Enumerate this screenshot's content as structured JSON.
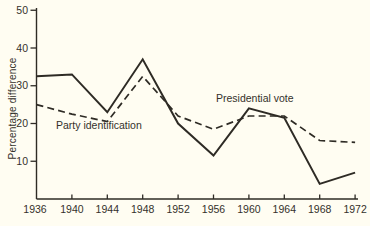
{
  "figure": {
    "ylabel": "Percentage difference",
    "series_labels": {
      "solid": "Presidential vote",
      "dashed": "Party identification"
    }
  },
  "chart_data": {
    "type": "line",
    "title": "",
    "xlabel": "",
    "ylabel": "Percentage difference",
    "x": [
      1936,
      1940,
      1944,
      1948,
      1952,
      1956,
      1960,
      1964,
      1968,
      1972
    ],
    "xtick_labels": [
      "1936",
      "1940",
      "1944",
      "1948",
      "1952",
      "1956",
      "1960",
      "1964",
      "1968",
      "1972"
    ],
    "yticks": [
      10,
      20,
      30,
      40,
      50
    ],
    "ytick_labels": [
      "10",
      "20",
      "30",
      "40",
      "50"
    ],
    "ylim": [
      0,
      50
    ],
    "grid": false,
    "legend_position": "inline-annotations",
    "series": [
      {
        "name": "Presidential vote",
        "line_style": "solid",
        "values": [
          32.5,
          33,
          23,
          37,
          20,
          11.5,
          24,
          21.5,
          4,
          7
        ]
      },
      {
        "name": "Party identification",
        "line_style": "dashed",
        "values": [
          25,
          22.5,
          20.5,
          32.5,
          22,
          18.5,
          22,
          22,
          15.5,
          15
        ]
      }
    ],
    "colors": {
      "line": "#2e2b25",
      "text": "#34312b",
      "background": "#fffdf2"
    }
  }
}
